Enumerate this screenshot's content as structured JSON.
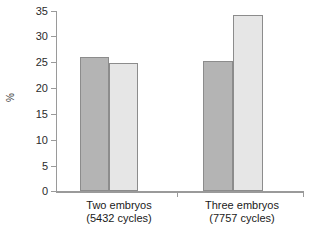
{
  "chart_data": {
    "type": "bar",
    "title": "",
    "xlabel": "",
    "ylabel": "%",
    "ylim": [
      0,
      35
    ],
    "grid": false,
    "legend": "none",
    "categories": [
      "Two embryos",
      "Three embryos"
    ],
    "category_sublabels": [
      "(5432 cycles)",
      "(7757 cycles)"
    ],
    "yticks": [
      0,
      5,
      10,
      15,
      20,
      25,
      30,
      35
    ],
    "ytick_labels": [
      "0",
      "5",
      "10",
      "15",
      "20",
      "25",
      "30",
      "35"
    ],
    "series": [
      {
        "name": "series-1",
        "color": "#b4b4b4",
        "values": [
          26.1,
          25.3
        ]
      },
      {
        "name": "series-2",
        "color": "#e6e6e6",
        "values": [
          24.9,
          34.2
        ]
      }
    ]
  },
  "axis": {
    "y_title": "%",
    "y_labels": [
      "35",
      "30",
      "25",
      "20",
      "15",
      "10",
      "5",
      "0"
    ]
  },
  "groups": [
    {
      "label": "Two embryos",
      "sublabel": "(5432 cycles)"
    },
    {
      "label": "Three embryos",
      "sublabel": "(7757 cycles)"
    }
  ],
  "colors": {
    "bar_dark": "#b4b4b4",
    "bar_light": "#e6e6e6",
    "bar_border": "#8c8c8c",
    "axis": "#9a9a9a",
    "text": "#1a1a1a"
  }
}
